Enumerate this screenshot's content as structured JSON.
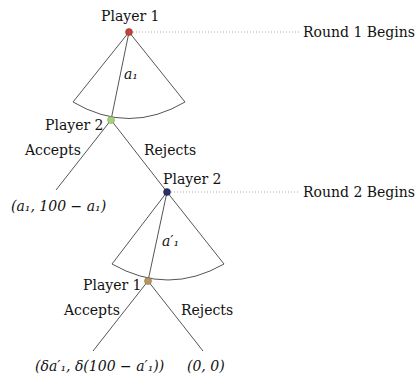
{
  "diagram": {
    "type": "extensive-form game tree",
    "rounds": [
      {
        "label": "Round 1 Begins"
      },
      {
        "label": "Round 2 Begins"
      }
    ],
    "nodes": [
      {
        "id": "n1",
        "player": "Player 1",
        "color": "#c0443a"
      },
      {
        "id": "n2",
        "player": "Player 2",
        "color": "#a6cf7e"
      },
      {
        "id": "n3",
        "player": "Player 2",
        "color": "#2b2f6b"
      },
      {
        "id": "n4",
        "player": "Player 1",
        "color": "#b8965e"
      }
    ],
    "offers": {
      "round1": "a₁",
      "round2": "a′₁"
    },
    "actions": {
      "n2_accept": "Accepts",
      "n2_reject": "Rejects",
      "n4_accept": "Accepts",
      "n4_reject": "Rejects"
    },
    "payoffs": {
      "p1": "(a₁, 100 − a₁)",
      "p2": "(δa′₁, δ(100 − a′₁))",
      "p3": "(0, 0)"
    }
  }
}
